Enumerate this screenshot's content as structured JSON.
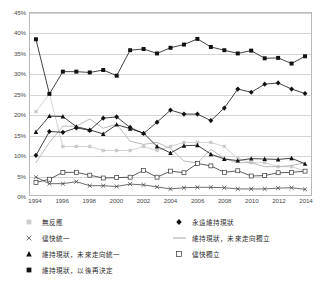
{
  "chart_data": {
    "type": "line",
    "title": "",
    "xlabel": "",
    "ylabel": "",
    "x": [
      1994,
      1995,
      1996,
      1997,
      1998,
      1999,
      2000,
      2001,
      2002,
      2003,
      2004,
      2005,
      2006,
      2007,
      2008,
      2009,
      2010,
      2011,
      2012,
      2013,
      2014
    ],
    "xlim": [
      1994,
      2014
    ],
    "ylim": [
      0,
      45
    ],
    "ytick_labels": [
      "45%",
      "40%",
      "35%",
      "30%",
      "25%",
      "20%",
      "15%",
      "10%",
      "5%",
      "0%"
    ],
    "ytick_values": [
      45,
      40,
      35,
      30,
      25,
      20,
      15,
      10,
      5,
      0
    ],
    "xtick_labels": [
      "1994",
      "1996",
      "1998",
      "2000",
      "2002",
      "2004",
      "2006",
      "2008",
      "2010",
      "2012",
      "2014"
    ],
    "xtick_values": [
      1994,
      1996,
      1998,
      2000,
      2002,
      2004,
      2006,
      2008,
      2010,
      2012,
      2014
    ],
    "grid": true,
    "legend_position": "below",
    "series": [
      {
        "name": "維持現狀，以後再決定",
        "marker": "filled-square",
        "color": "#111111",
        "values": [
          38.5,
          25.0,
          30.5,
          30.5,
          30.3,
          30.9,
          29.5,
          35.8,
          36.1,
          35.0,
          36.4,
          37.2,
          38.6,
          36.6,
          35.8,
          35.0,
          35.7,
          33.8,
          33.9,
          32.5,
          34.3
        ]
      },
      {
        "name": "永遠維持現狀",
        "marker": "filled-diamond",
        "color": "#111111",
        "values": [
          9.8,
          15.7,
          15.5,
          16.6,
          16.0,
          19.0,
          19.3,
          16.7,
          15.2,
          18.0,
          21.0,
          20.0,
          20.0,
          18.4,
          21.5,
          26.2,
          25.4,
          27.4,
          27.7,
          26.2,
          25.1
        ]
      },
      {
        "name": "維持現狀，未來走向統一",
        "marker": "filled-triangle",
        "color": "#111111",
        "values": [
          15.6,
          19.5,
          19.4,
          16.9,
          16.1,
          15.1,
          17.4,
          16.4,
          15.3,
          12.0,
          10.4,
          12.2,
          12.3,
          10.1,
          8.9,
          8.5,
          9.0,
          8.9,
          8.8,
          9.1,
          7.7
        ]
      },
      {
        "name": "維持現狀，未來走向獨立",
        "marker": "line",
        "color": "#b0b0b0",
        "values": [
          8.0,
          13.0,
          17.0,
          17.0,
          18.8,
          16.5,
          17.5,
          13.3,
          12.5,
          13.0,
          11.5,
          8.4,
          7.9,
          11.3,
          9.0,
          8.0,
          8.0,
          7.0,
          7.0,
          7.3,
          8.0
        ]
      },
      {
        "name": "無反應",
        "marker": "faint-square",
        "color": "#cccccc",
        "values": [
          20.6,
          25.0,
          12.0,
          12.0,
          12.0,
          11.0,
          11.0,
          11.0,
          12.0,
          11.0,
          12.0,
          13.0,
          13.0,
          13.0,
          12.0,
          9.0,
          8.0,
          8.0,
          7.0,
          7.0,
          6.0
        ]
      },
      {
        "name": "儘快獨立",
        "marker": "open-square",
        "color": "#333333",
        "values": [
          3.1,
          3.9,
          5.6,
          5.6,
          4.9,
          4.2,
          4.3,
          4.4,
          6.1,
          4.4,
          5.9,
          5.5,
          7.8,
          7.2,
          5.6,
          6.0,
          4.7,
          4.8,
          5.5,
          5.6,
          5.9
        ]
      },
      {
        "name": "儘快統一",
        "marker": "x-cross",
        "color": "#444444",
        "values": [
          4.4,
          2.8,
          2.8,
          3.3,
          2.3,
          2.3,
          2.1,
          2.7,
          2.5,
          2.0,
          1.5,
          1.8,
          1.9,
          1.9,
          1.8,
          1.5,
          1.5,
          1.5,
          1.7,
          1.8,
          1.4
        ]
      }
    ]
  },
  "legend": {
    "left_items": [
      {
        "label": "無反應",
        "marker": "faint-square",
        "series_index": 4
      },
      {
        "label": "儘快統一",
        "marker": "x-cross",
        "series_index": 6
      },
      {
        "label": "維持現狀，未來走向統一",
        "marker": "filled-triangle",
        "series_index": 2
      },
      {
        "label": "維持現狀，以後再決定",
        "marker": "filled-square",
        "series_index": 0
      }
    ],
    "right_items": [
      {
        "label": "永遠維持現狀",
        "marker": "filled-diamond",
        "series_index": 1
      },
      {
        "label": "維持現狀，未來走向獨立",
        "marker": "line",
        "series_index": 3
      },
      {
        "label": "儘快獨立",
        "marker": "open-square",
        "series_index": 5
      }
    ]
  },
  "colors": {
    "grid": "#d4d4d4",
    "frame": "#b9b9b9",
    "dark": "#111111",
    "grey_line": "#b0b0b0",
    "faint": "#cccccc",
    "text": "#4a4a4a",
    "background": "#ffffff"
  }
}
